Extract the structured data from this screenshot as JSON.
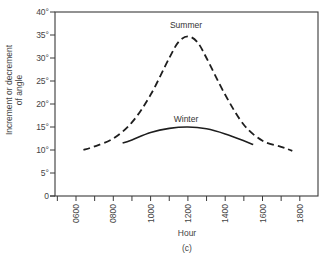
{
  "chart_data": {
    "type": "line",
    "title": "",
    "caption": "(c)",
    "xlabel": "Hour",
    "ylabel": "Increment or decrement of angle",
    "ylabel_lines": [
      "Increment or decrement",
      "of angle"
    ],
    "x_ticks": [
      "0600",
      "0800",
      "1000",
      "1200",
      "1400",
      "1600",
      "1800"
    ],
    "x_tick_values": [
      6,
      8,
      10,
      12,
      14,
      16,
      18
    ],
    "y_ticks": [
      "0",
      "5°",
      "10°",
      "15°",
      "20°",
      "25°",
      "30°",
      "35°",
      "40°"
    ],
    "y_tick_values": [
      0,
      5,
      10,
      15,
      20,
      25,
      30,
      35,
      40
    ],
    "xlim": [
      4.9,
      19
    ],
    "ylim": [
      0,
      40
    ],
    "grid": false,
    "legend": "inline labels",
    "series": [
      {
        "name": "Summer",
        "style": "dashed",
        "x": [
          6.4,
          7,
          8,
          9,
          10,
          11,
          11.5,
          12,
          12.5,
          13,
          14,
          15,
          16,
          17,
          17.6
        ],
        "y": [
          10,
          10.8,
          12.5,
          16,
          22,
          30,
          33.5,
          34.7,
          33.5,
          30,
          22,
          15.5,
          12,
          10.7,
          9.8
        ]
      },
      {
        "name": "Winter",
        "style": "solid",
        "x": [
          8.5,
          9,
          10,
          11,
          12,
          13,
          14,
          15,
          15.5
        ],
        "y": [
          11.5,
          12.2,
          13.8,
          14.7,
          15,
          14.6,
          13.5,
          12,
          11.2
        ]
      }
    ]
  }
}
